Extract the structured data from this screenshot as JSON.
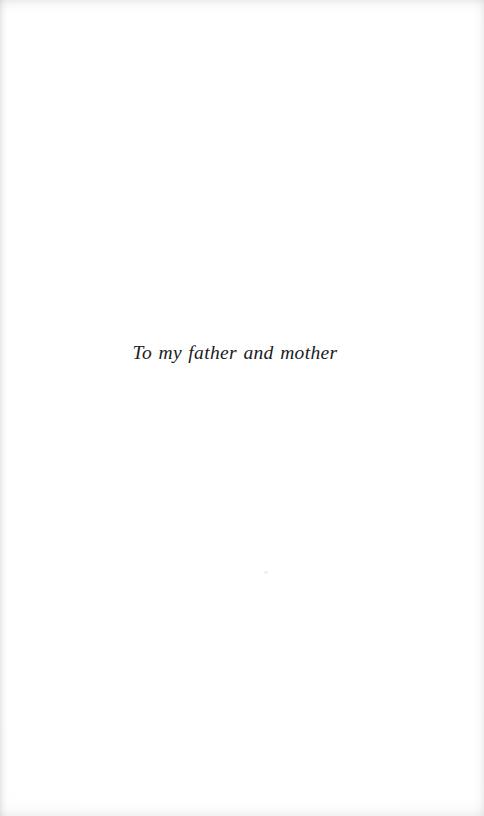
{
  "document": {
    "type": "book-dedication-page",
    "page_background_color": "#fefefe",
    "ink_color": "#1b1b1d"
  },
  "dedication": {
    "text": "To my father and mother"
  },
  "artifacts": {
    "speck_label": "",
    "left_edge_label": "",
    "right_edge_label": "",
    "top_edge_label": "",
    "bottom_edge_label": ""
  }
}
